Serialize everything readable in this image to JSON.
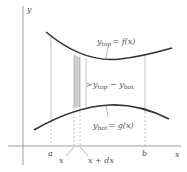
{
  "diagram": {
    "type": "area-between-curves",
    "axes": {
      "x_label": "x",
      "y_label": "y"
    },
    "curves": {
      "top": {
        "var": "y",
        "sub": "top",
        "eq": "= f(x)"
      },
      "bottom": {
        "var": "y",
        "sub": "bot",
        "eq": "= g(x)"
      }
    },
    "strip_label": {
      "var1": "y",
      "sub1": "top",
      "minus": " − ",
      "var2": "y",
      "sub2": "bot"
    },
    "ticks": {
      "a": "a",
      "b": "b",
      "x": "x",
      "x_dx": "x + dx"
    },
    "colors": {
      "curve": "#333333",
      "axis": "#888888",
      "strip_fill": "#cfcfcf",
      "guide": "#999999",
      "text": "#555555"
    }
  }
}
